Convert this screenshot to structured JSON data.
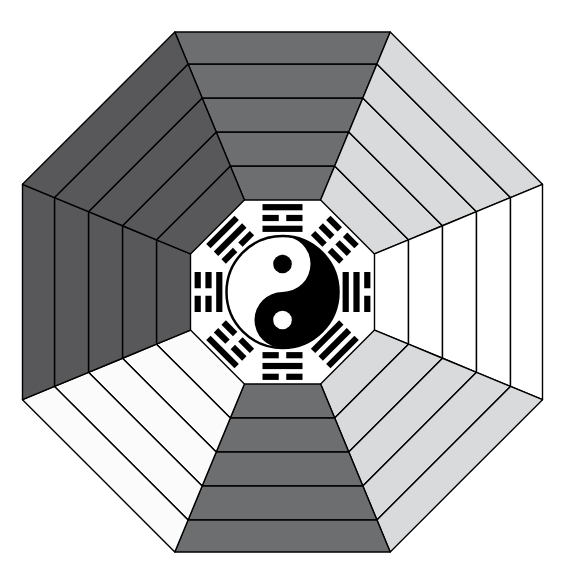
{
  "diagram": {
    "center_symbol": "yin-yang",
    "ring_order": [
      "trigram_name",
      "element",
      "color",
      "direction",
      "aspiration"
    ],
    "palette": {
      "dark_gray": "#58585a",
      "mid_gray": "#6d6e70",
      "light_gray": "#d9dadb",
      "pale_gray": "#efefef",
      "white": "#ffffff",
      "outline": "#000000",
      "text": "#111111",
      "yin_black": "#000000",
      "yang_white": "#ffffff"
    },
    "sectors": [
      {
        "key": "south",
        "aspiration": "Recognition & Fame",
        "direction": "South",
        "color": "Red",
        "element": "Fire",
        "trigram": "Li",
        "fill": "#6d6e70",
        "text_color": "#111111",
        "angle": 270,
        "trigram_lines": [
          "solid",
          "broken",
          "solid"
        ]
      },
      {
        "key": "south-west",
        "aspiration": "Marriage & Romance",
        "direction": "South-West",
        "color": "Yellow",
        "element": "Strong Earth",
        "trigram": "K'un",
        "fill": "#d9dadb",
        "text_color": "#111111",
        "angle": 315,
        "trigram_lines": [
          "broken",
          "broken",
          "broken"
        ]
      },
      {
        "key": "west",
        "aspiration": "Children",
        "direction": "West",
        "color": "Metallic White",
        "element": "Small Metal",
        "trigram": "Tui",
        "fill": "#ffffff",
        "text_color": "#111111",
        "angle": 0,
        "trigram_lines": [
          "broken",
          "solid",
          "solid"
        ]
      },
      {
        "key": "north-west",
        "aspiration": "Mentors & Social contacts",
        "direction": "North-West",
        "color": "Metallic Gold",
        "element": "Strong Metal",
        "trigram": "Chyan",
        "fill": "#d9dadb",
        "text_color": "#111111",
        "angle": 45,
        "trigram_lines": [
          "solid",
          "solid",
          "solid"
        ]
      },
      {
        "key": "north",
        "aspiration": "Career Prospects",
        "direction": "North",
        "color": "Black, Blue",
        "element": "Water",
        "trigram": "K'an",
        "fill": "#6d6e70",
        "text_color": "#111111",
        "angle": 90,
        "trigram_lines": [
          "broken",
          "solid",
          "broken"
        ]
      },
      {
        "key": "north-east",
        "aspiration": "Education & Knowledge",
        "direction": "North-East",
        "color": "Beige",
        "element": "Small Earth",
        "trigram": "Ken",
        "fill": "#fbfbfb",
        "text_color": "#111111",
        "angle": 135,
        "trigram_lines": [
          "solid",
          "broken",
          "broken"
        ]
      },
      {
        "key": "east",
        "aspiration": "Family & Health",
        "direction": "East",
        "color": "Green, Brown",
        "element": "Strong Wood",
        "trigram": "Chen",
        "fill": "#58585a",
        "text_color": "#111111",
        "angle": 180,
        "trigram_lines": [
          "broken",
          "broken",
          "solid"
        ]
      },
      {
        "key": "south-east",
        "aspiration": "Wealth & Prosperity",
        "direction": "South-East",
        "color": "Green",
        "element": "Small Wood",
        "trigram": "Sun",
        "fill": "#58585a",
        "text_color": "#111111",
        "angle": 225,
        "trigram_lines": [
          "solid",
          "solid",
          "broken"
        ]
      }
    ]
  }
}
